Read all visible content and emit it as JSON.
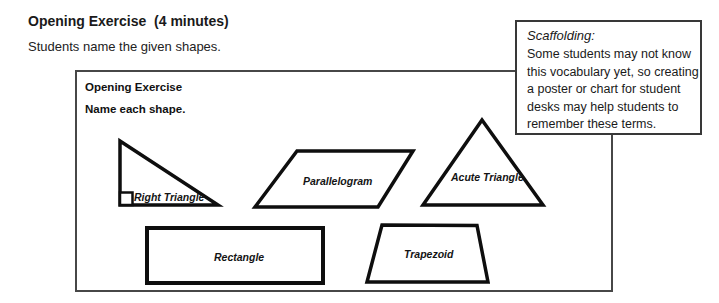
{
  "page": {
    "title": "Opening Exercise  (4 minutes)",
    "subtitle": "Students name the given shapes."
  },
  "worksheet": {
    "heading": "Opening Exercise",
    "instruction": "Name each shape.",
    "shapes": [
      {
        "label": "Right Triangle"
      },
      {
        "label": "Parallelogram"
      },
      {
        "label": "Acute Triangle"
      },
      {
        "label": "Rectangle"
      },
      {
        "label": "Trapezoid"
      }
    ]
  },
  "scaffolding": {
    "title": "Scaffolding:",
    "lines": [
      "Some students may not know",
      "this vocabulary yet, so creating",
      "a poster or chart for student",
      "desks may help students to",
      "remember these terms."
    ]
  },
  "colors": {
    "background": "#ffffff",
    "text": "#1a1a1a",
    "shape_outline": "#0e0e0e",
    "box_border": "#474747"
  }
}
